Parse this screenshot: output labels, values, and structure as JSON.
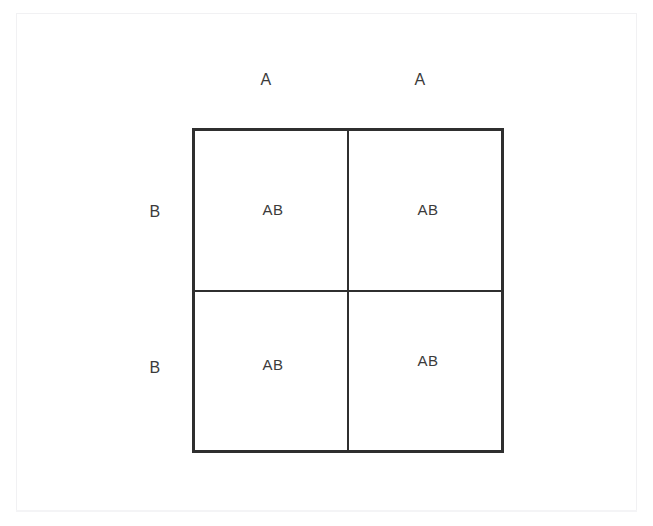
{
  "figure": {
    "type": "punnett-square",
    "background_color": "#ffffff",
    "line_color": "#2f2f2f",
    "text_color": "#3b3b3b",
    "column_labels": [
      "A",
      "A"
    ],
    "row_labels": [
      "B",
      "B"
    ],
    "cells": [
      {
        "id": "cell-0-0",
        "genotype": "AB"
      },
      {
        "id": "cell-0-1",
        "genotype": "AB"
      },
      {
        "id": "cell-1-0",
        "genotype": "AB"
      },
      {
        "id": "cell-1-1",
        "genotype": "AB"
      }
    ]
  },
  "chart_data": {
    "type": "table",
    "title": "",
    "columns": [
      "A",
      "A"
    ],
    "rows": [
      "B",
      "B"
    ],
    "values": [
      [
        "AB",
        "AB"
      ],
      [
        "AB",
        "AB"
      ]
    ],
    "grid": true,
    "legend": "none"
  }
}
